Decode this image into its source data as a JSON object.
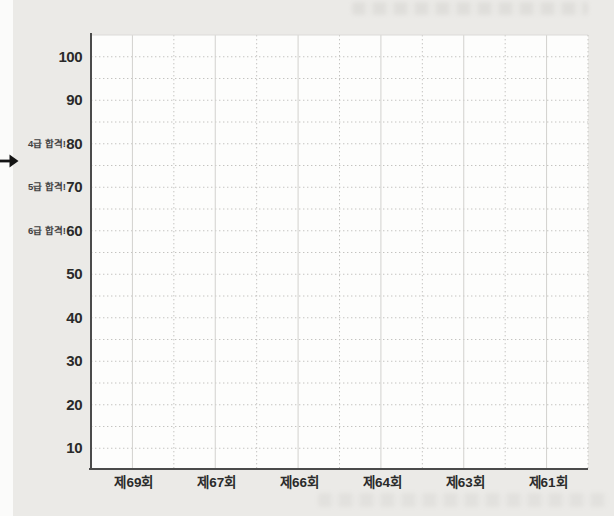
{
  "colors": {
    "page_bg": "#ebeae7",
    "plot_bg": "#fdfdfc",
    "axis": "#4b4b4b",
    "grid_dotted": "#c4c3c0",
    "grid_solid": "#d2d1ce",
    "text": "#2a2a2a",
    "arrow": "#141414"
  },
  "icons": {
    "left_margin_arrow": "right-arrow-icon"
  },
  "chart_data": {
    "type": "line",
    "title": "",
    "xlabel": "",
    "ylabel": "",
    "categories": [
      "제69회",
      "제67회",
      "제66회",
      "제64회",
      "제63회",
      "제61회"
    ],
    "series": [],
    "ylim": [
      5,
      105
    ],
    "yticks": [
      100,
      90,
      80,
      70,
      60,
      50,
      40,
      30,
      20,
      10
    ],
    "y_minor_step": 5,
    "grid": true,
    "legend_position": "none",
    "annotations": [
      {
        "label": "4급 합격!",
        "value": 80
      },
      {
        "label": "5급 합격!",
        "value": 70
      },
      {
        "label": "6급 합격!",
        "value": 60
      }
    ]
  }
}
